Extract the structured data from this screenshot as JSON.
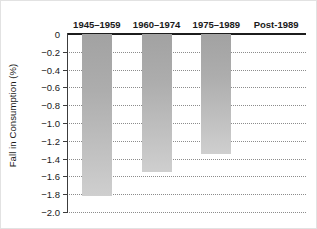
{
  "chart_data": {
    "type": "bar",
    "title": "",
    "xlabel": "",
    "ylabel": "Fall in Consumption (%)",
    "categories": [
      "1945–1959",
      "1960–1974",
      "1975–1989",
      "Post-1989"
    ],
    "values": [
      -1.82,
      -1.55,
      -1.35,
      0
    ],
    "ylim": [
      -2.0,
      0
    ],
    "ytick_labels": [
      "0",
      "−0.2",
      "−0.4",
      "−0.6",
      "−0.8",
      "−1.0",
      "−1.2",
      "−1.4",
      "−1.6",
      "−1.8",
      "−2.0"
    ],
    "ytick_values": [
      0,
      -0.2,
      -0.4,
      -0.6,
      -0.8,
      -1.0,
      -1.2,
      -1.4,
      -1.6,
      -1.8,
      -2.0
    ],
    "grid": true,
    "grid_style": "dotted",
    "legend": false,
    "category_label_position": "top",
    "bar_color_top": "#a2a2a2",
    "bar_color_bottom": "#cfcfcf",
    "axis_color": "#1c1c1c",
    "grid_color": "#8c8c8c",
    "background": "#ffffff"
  }
}
